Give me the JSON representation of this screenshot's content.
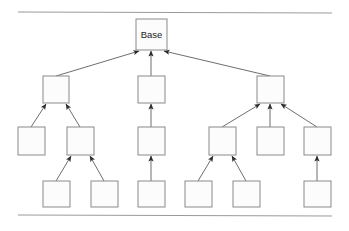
{
  "figure": {
    "background_color": "#ffffff",
    "width": 349,
    "height": 231,
    "node_fill_color": "#fcfcfc",
    "node_stroke_color": "#8a8a8a",
    "edge_color": "#6e6e6e",
    "rule_color": "#9a9a9a",
    "label_color": "#1a1a1a"
  },
  "rules": {
    "top": {
      "x1": 18,
      "y1": 12,
      "x2": 332,
      "y2": 13
    },
    "bottom": {
      "x1": 18,
      "y1": 215,
      "x2": 332,
      "y2": 216
    }
  },
  "nodes": [
    {
      "id": "base",
      "label": "Base",
      "x": 136,
      "y": 19,
      "w": 31,
      "h": 31,
      "level": 1
    },
    {
      "id": "l2a",
      "label": "",
      "x": 43,
      "y": 76,
      "w": 26,
      "h": 27,
      "level": 2
    },
    {
      "id": "l2b",
      "label": "",
      "x": 138,
      "y": 76,
      "w": 27,
      "h": 27,
      "level": 2
    },
    {
      "id": "l2c",
      "label": "",
      "x": 257,
      "y": 76,
      "w": 27,
      "h": 27,
      "level": 2
    },
    {
      "id": "l3a",
      "label": "",
      "x": 18,
      "y": 127,
      "w": 27,
      "h": 28,
      "level": 3
    },
    {
      "id": "l3b",
      "label": "",
      "x": 67,
      "y": 127,
      "w": 27,
      "h": 28,
      "level": 3
    },
    {
      "id": "l3c",
      "label": "",
      "x": 138,
      "y": 127,
      "w": 27,
      "h": 28,
      "level": 3
    },
    {
      "id": "l3d",
      "label": "",
      "x": 209,
      "y": 127,
      "w": 27,
      "h": 28,
      "level": 3
    },
    {
      "id": "l3e",
      "label": "",
      "x": 257,
      "y": 127,
      "w": 27,
      "h": 28,
      "level": 3
    },
    {
      "id": "l3f",
      "label": "",
      "x": 304,
      "y": 127,
      "w": 27,
      "h": 28,
      "level": 3
    },
    {
      "id": "l4a",
      "label": "",
      "x": 43,
      "y": 181,
      "w": 27,
      "h": 26,
      "level": 4
    },
    {
      "id": "l4b",
      "label": "",
      "x": 91,
      "y": 181,
      "w": 27,
      "h": 26,
      "level": 4
    },
    {
      "id": "l4c",
      "label": "",
      "x": 138,
      "y": 181,
      "w": 27,
      "h": 26,
      "level": 4
    },
    {
      "id": "l4d",
      "label": "",
      "x": 185,
      "y": 181,
      "w": 27,
      "h": 26,
      "level": 4
    },
    {
      "id": "l4e",
      "label": "",
      "x": 233,
      "y": 181,
      "w": 27,
      "h": 26,
      "level": 4
    },
    {
      "id": "l4f",
      "label": "",
      "x": 304,
      "y": 181,
      "w": 27,
      "h": 26,
      "level": 4
    }
  ],
  "edges": [
    {
      "from": "l2a",
      "to": "base",
      "x1": 56,
      "y1": 76,
      "x2": 139,
      "y2": 51,
      "arrow": true
    },
    {
      "from": "l2b",
      "to": "base",
      "x1": 151,
      "y1": 76,
      "x2": 151,
      "y2": 51,
      "arrow": true
    },
    {
      "from": "l2c",
      "to": "base",
      "x1": 270,
      "y1": 76,
      "x2": 164,
      "y2": 51,
      "arrow": true
    },
    {
      "from": "l3a",
      "to": "l2a",
      "x1": 31,
      "y1": 127,
      "x2": 46,
      "y2": 104,
      "arrow": true
    },
    {
      "from": "l3b",
      "to": "l2a",
      "x1": 80,
      "y1": 127,
      "x2": 66,
      "y2": 104,
      "arrow": true
    },
    {
      "from": "l3c",
      "to": "l2b",
      "x1": 151,
      "y1": 127,
      "x2": 151,
      "y2": 104,
      "arrow": true
    },
    {
      "from": "l3d",
      "to": "l2c",
      "x1": 222,
      "y1": 127,
      "x2": 260,
      "y2": 104,
      "arrow": true
    },
    {
      "from": "l3e",
      "to": "l2c",
      "x1": 270,
      "y1": 127,
      "x2": 270,
      "y2": 104,
      "arrow": true
    },
    {
      "from": "l3f",
      "to": "l2c",
      "x1": 317,
      "y1": 127,
      "x2": 281,
      "y2": 104,
      "arrow": true
    },
    {
      "from": "l4a",
      "to": "l3b",
      "x1": 56,
      "y1": 181,
      "x2": 71,
      "y2": 156,
      "arrow": true
    },
    {
      "from": "l4b",
      "to": "l3b",
      "x1": 104,
      "y1": 181,
      "x2": 90,
      "y2": 156,
      "arrow": true
    },
    {
      "from": "l4c",
      "to": "l3c",
      "x1": 151,
      "y1": 181,
      "x2": 151,
      "y2": 156,
      "arrow": true
    },
    {
      "from": "l4d",
      "to": "l3d",
      "x1": 198,
      "y1": 181,
      "x2": 213,
      "y2": 156,
      "arrow": true
    },
    {
      "from": "l4e",
      "to": "l3d",
      "x1": 246,
      "y1": 181,
      "x2": 232,
      "y2": 156,
      "arrow": true
    },
    {
      "from": "l4f",
      "to": "l3f",
      "x1": 317,
      "y1": 181,
      "x2": 317,
      "y2": 156,
      "arrow": true
    }
  ]
}
